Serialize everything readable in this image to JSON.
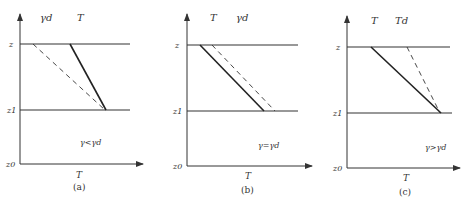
{
  "figure": {
    "panels": [
      {
        "id": "a",
        "caption": "(a)",
        "top_labels": [
          "γd",
          "T"
        ],
        "y_labels": [
          "z",
          "z1",
          "z0"
        ],
        "x_label": "T",
        "condition": "γ<γd",
        "solid_line_label": "T",
        "dashed_line_label": "γd"
      },
      {
        "id": "b",
        "caption": "(b)",
        "top_labels": [
          "T",
          "γd"
        ],
        "y_labels": [
          "z",
          "z1",
          "z0"
        ],
        "x_label": "T",
        "condition": "γ=γd",
        "solid_line_label": "T",
        "dashed_line_label": "γd"
      },
      {
        "id": "c",
        "caption": "(c)",
        "top_labels": [
          "T",
          "Td"
        ],
        "y_labels": [
          "z",
          "z1",
          "z0"
        ],
        "x_label": "T",
        "condition": "γ>γd",
        "solid_line_label": "T",
        "dashed_line_label": "Td"
      }
    ],
    "colors": {
      "line": "#333333",
      "background": "#ffffff"
    }
  }
}
